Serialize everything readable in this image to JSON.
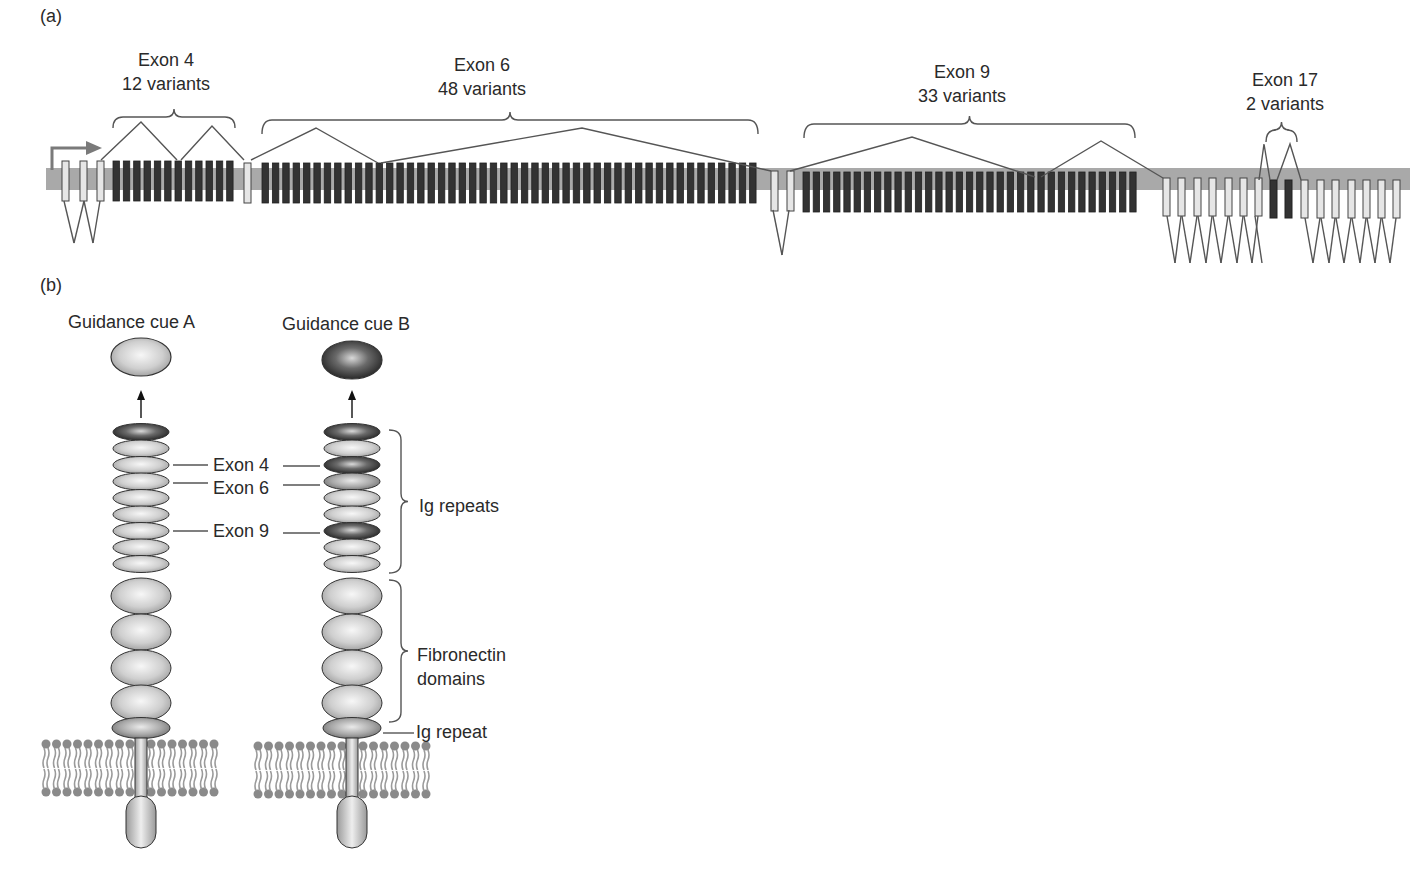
{
  "panel_a": {
    "label": "(a)",
    "gene_bar_color": "#a9a9a9",
    "constant_exon_color": "#e6e6e6",
    "variable_exon_color": "#333333",
    "clusters": [
      {
        "name": "Exon 4",
        "variants": "12 variants",
        "count": 12,
        "x_start": 113,
        "x_end": 237,
        "label_x": 166
      },
      {
        "name": "Exon 6",
        "variants": "48 variants",
        "count": 48,
        "x_start": 262,
        "x_end": 760,
        "label_x": 482
      },
      {
        "name": "Exon 9",
        "variants": "33 variants",
        "count": 33,
        "x_start": 803,
        "x_end": 1140,
        "label_x": 962
      },
      {
        "name": "Exon 17",
        "variants": "2 variants",
        "count": 2,
        "x_start": 1268,
        "x_end": 1296,
        "label_x": 1285
      }
    ]
  },
  "panel_b": {
    "label": "(b)",
    "cue_a": {
      "label": "Guidance cue A",
      "color": "#b8b8b8"
    },
    "cue_b": {
      "label": "Guidance cue B",
      "color": "#3a3a3a"
    },
    "exon_labels": [
      "Exon 4",
      "Exon 6",
      "Exon 9"
    ],
    "bracket_labels": {
      "ig_repeats": "Ig repeats",
      "fibronectin_line1": "Fibronectin",
      "fibronectin_line2": "domains",
      "ig_repeat": "Ig repeat"
    }
  }
}
